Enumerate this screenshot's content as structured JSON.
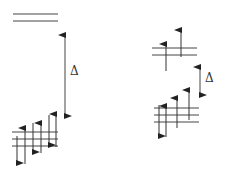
{
  "diagram": {
    "type": "crystal-field-splitting",
    "left": {
      "label": "Δ",
      "upper_levels": 2,
      "lower_levels": 3,
      "electrons": [
        "down",
        "up",
        "down",
        "up",
        "down",
        "up"
      ]
    },
    "right": {
      "label": "Δ",
      "upper_levels": 2,
      "lower_levels": 3,
      "electrons_upper": [
        "up",
        "up"
      ],
      "electrons_lower": [
        "down",
        "up",
        "up",
        "up"
      ]
    },
    "colors": {
      "line": "#3a3a3a",
      "background": "#ffffff"
    }
  }
}
